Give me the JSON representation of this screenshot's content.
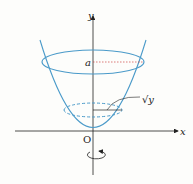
{
  "diagram": {
    "type": "solid-of-revolution",
    "axes": {
      "x_label": "x",
      "y_label": "y",
      "origin_label": "O"
    },
    "labels": {
      "height": "a",
      "radius": "√y",
      "radius_sqrt": "√",
      "radius_var": "y"
    },
    "colors": {
      "curve": "#4a9ac9",
      "axis": "#222222",
      "background": "#fdfdfb"
    }
  }
}
